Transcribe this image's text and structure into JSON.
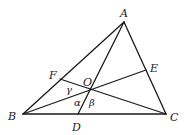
{
  "diagram": {
    "title": "",
    "points": {
      "A": {
        "label": "A"
      },
      "B": {
        "label": "B"
      },
      "C": {
        "label": "C"
      },
      "D": {
        "label": "D"
      },
      "E": {
        "label": "E"
      },
      "F": {
        "label": "F"
      },
      "O": {
        "label": "O"
      }
    },
    "segments": [
      [
        "A",
        "B"
      ],
      [
        "B",
        "C"
      ],
      [
        "C",
        "A"
      ],
      [
        "A",
        "D"
      ],
      [
        "B",
        "E"
      ],
      [
        "C",
        "F"
      ]
    ],
    "angles": {
      "alpha": "α",
      "beta": "β",
      "gamma": "γ"
    }
  }
}
